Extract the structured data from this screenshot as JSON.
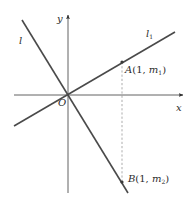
{
  "diagram": {
    "colors": {
      "background": "#ffffff",
      "axis": "#3a3a3a",
      "line": "#4a4a4a",
      "dashed": "#8a8a8a",
      "text": "#2b2b2b"
    },
    "axes": {
      "x_label": "x",
      "y_label": "y",
      "origin_label": "O"
    },
    "lines": [
      {
        "id": "l",
        "label": "l",
        "description": "line with negative slope through origin"
      },
      {
        "id": "l1",
        "label_main": "l",
        "label_sub": "1",
        "description": "line with positive slope through origin"
      }
    ],
    "points": {
      "A": {
        "name": "A",
        "open": "(1, ",
        "var": "m",
        "sub": "1",
        "close": ")"
      },
      "B": {
        "name": "B",
        "open": "(1, ",
        "var": "m",
        "sub": "2",
        "close": ")"
      }
    },
    "dashed_segment": "vertical segment x = 1 from A to B"
  }
}
